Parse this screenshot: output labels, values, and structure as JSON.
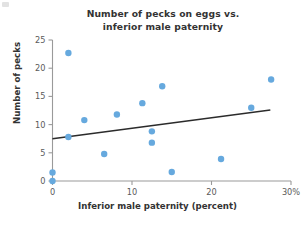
{
  "figure": {
    "title_lines": [
      "Number of pecks on eggs vs.",
      "inferior male paternity"
    ],
    "background_color": "#ffffff"
  },
  "chart_data": {
    "type": "scatter",
    "title": "Number of pecks on eggs vs. inferior male paternity",
    "xlabel": "Inferior male paternity (percent)",
    "ylabel": "Number of pecks",
    "xlim": [
      0,
      30
    ],
    "ylim": [
      0,
      25
    ],
    "xticks": [
      0,
      10,
      20,
      30
    ],
    "xtick_labels": [
      "0",
      "10",
      "20",
      "30%"
    ],
    "yticks": [
      0,
      5,
      10,
      15,
      20,
      25
    ],
    "ytick_labels": [
      "0",
      "5",
      "10",
      "15",
      "20",
      "25"
    ],
    "grid": false,
    "legend": false,
    "marker_color": "#66A9DE",
    "marker_size": 6.4,
    "points": [
      {
        "x": 0.0,
        "y": 0.0
      },
      {
        "x": 0.0,
        "y": 1.5
      },
      {
        "x": 2.0,
        "y": 7.8
      },
      {
        "x": 2.0,
        "y": 22.7
      },
      {
        "x": 4.0,
        "y": 10.8
      },
      {
        "x": 6.5,
        "y": 4.8
      },
      {
        "x": 8.1,
        "y": 11.8
      },
      {
        "x": 11.3,
        "y": 13.8
      },
      {
        "x": 12.5,
        "y": 8.8
      },
      {
        "x": 12.5,
        "y": 6.8
      },
      {
        "x": 13.8,
        "y": 16.8
      },
      {
        "x": 15.0,
        "y": 1.6
      },
      {
        "x": 21.2,
        "y": 3.9
      },
      {
        "x": 25.0,
        "y": 13.0
      },
      {
        "x": 27.5,
        "y": 18.0
      }
    ],
    "trend_line": {
      "type": "linear-fit",
      "color": "#2b2b2b",
      "x_start": 0.0,
      "y_start": 7.5,
      "x_end": 27.4,
      "y_end": 12.6
    }
  }
}
